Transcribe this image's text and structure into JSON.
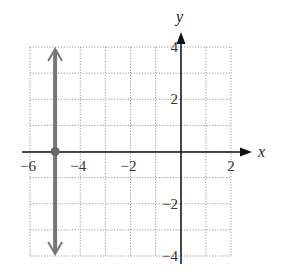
{
  "chart_data": {
    "type": "line",
    "title": "",
    "xlabel": "x",
    "ylabel": "y",
    "xlim": [
      -6,
      2
    ],
    "ylim": [
      -4,
      4
    ],
    "grid": true,
    "grid_style": "dotted",
    "x_tick_labels": [
      "-6",
      "-4",
      "-2",
      "2"
    ],
    "x_tick_values": [
      -6,
      -4,
      -2,
      2
    ],
    "y_tick_labels": [
      "4",
      "2",
      "-2",
      "-4"
    ],
    "y_tick_values": [
      4,
      2,
      -2,
      -4
    ],
    "series": [
      {
        "name": "x = -5",
        "kind": "vertical-line",
        "x": [
          -5,
          -5
        ],
        "y": [
          -4,
          4
        ],
        "arrows": "both",
        "color": "#777777",
        "marked_point": {
          "x": -5,
          "y": 0
        }
      }
    ]
  },
  "axes": {
    "x_label": "x",
    "y_label": "y",
    "x_ticks": [
      {
        "value": -6,
        "label": "−6"
      },
      {
        "value": -4,
        "label": "−4"
      },
      {
        "value": -2,
        "label": "−2"
      },
      {
        "value": 2,
        "label": "2"
      }
    ],
    "y_ticks": [
      {
        "value": 4,
        "label": "4"
      },
      {
        "value": 2,
        "label": "2"
      },
      {
        "value": -2,
        "label": "−2"
      },
      {
        "value": -4,
        "label": "−4"
      }
    ]
  }
}
